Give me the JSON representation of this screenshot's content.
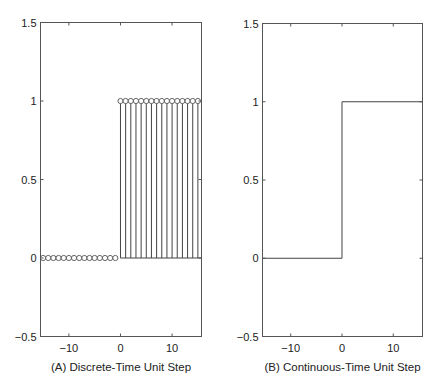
{
  "chart_data": [
    {
      "id": "A",
      "type": "stem",
      "caption": "(A) Discrete-Time Unit Step",
      "title": "",
      "xlabel": "(A) Discrete-Time Unit Step",
      "ylabel": "",
      "xlim": [
        -15.5,
        15.7
      ],
      "ylim": [
        -0.5,
        1.5
      ],
      "xticks": [
        -10,
        0,
        10
      ],
      "xtick_labels": [
        "−10",
        "0",
        "10"
      ],
      "yticks": [
        -0.5,
        0,
        0.5,
        1,
        1.5
      ],
      "ytick_labels": [
        "−0.5",
        "0",
        "0.5",
        "1",
        "1.5"
      ],
      "grid": false,
      "legend": null,
      "marker": "open-circle",
      "x": [
        -15,
        -14,
        -13,
        -12,
        -11,
        -10,
        -9,
        -8,
        -7,
        -6,
        -5,
        -4,
        -3,
        -2,
        -1,
        0,
        1,
        2,
        3,
        4,
        5,
        6,
        7,
        8,
        9,
        10,
        11,
        12,
        13,
        14,
        15
      ],
      "y": [
        0,
        0,
        0,
        0,
        0,
        0,
        0,
        0,
        0,
        0,
        0,
        0,
        0,
        0,
        0,
        1,
        1,
        1,
        1,
        1,
        1,
        1,
        1,
        1,
        1,
        1,
        1,
        1,
        1,
        1,
        1
      ]
    },
    {
      "id": "B",
      "type": "line",
      "caption": "(B) Continuous-Time Unit Step",
      "title": "",
      "xlabel": "(B) Continuous-Time Unit Step",
      "ylabel": "",
      "xlim": [
        -15.5,
        15.7
      ],
      "ylim": [
        -0.5,
        1.5
      ],
      "xticks": [
        -10,
        0,
        10
      ],
      "xtick_labels": [
        "−10",
        "0",
        "10"
      ],
      "yticks": [
        -0.5,
        0,
        0.5,
        1,
        1.5
      ],
      "ytick_labels": [
        "−0.5",
        "0",
        "0.5",
        "1",
        "1.5"
      ],
      "grid": false,
      "legend": null,
      "x": [
        -15.5,
        0,
        0,
        15.7
      ],
      "y": [
        0,
        0,
        1,
        1
      ]
    }
  ],
  "layout": {
    "panels": [
      {
        "left": 40.5,
        "top": 22.5,
        "right": 201.5,
        "bottom": 336.5
      },
      {
        "left": 262.5,
        "top": 23.5,
        "right": 422.5,
        "bottom": 336.5
      }
    ]
  }
}
